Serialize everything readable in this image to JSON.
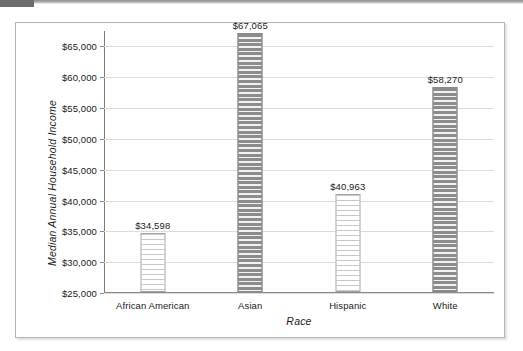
{
  "chart_data": {
    "type": "bar",
    "title": "",
    "subtitle": "",
    "xlabel": "Race",
    "ylabel": "Median Annual Household Income",
    "categories": [
      "African American",
      "Asian",
      "Hispanic",
      "White"
    ],
    "values": [
      34598,
      67065,
      40963,
      58270
    ],
    "value_labels": [
      "$34,598",
      "$67,065",
      "$40,963",
      "$58,270"
    ],
    "bar_styles": [
      "light",
      "dark",
      "light",
      "dark"
    ],
    "ylim": [
      25000,
      67500
    ],
    "ytick_values": [
      25000,
      30000,
      35000,
      40000,
      45000,
      50000,
      55000,
      60000,
      65000
    ],
    "ytick_labels": [
      "$25,000",
      "$30,000",
      "$35,000",
      "$40,000",
      "$45,000",
      "$50,000",
      "$55,000",
      "$60,000",
      "$65,000"
    ],
    "grid": true,
    "grid_axis": "y",
    "legend": false,
    "legend_position": "none",
    "colors": {
      "bar_dark": "#8c8c8c",
      "bar_light": "#c9c9c9",
      "gridline": "#dcdcdc",
      "axis": "#7a7a7a",
      "text": "#1a1a1a",
      "frame": "#b4b4b4",
      "background": "#ffffff"
    }
  }
}
